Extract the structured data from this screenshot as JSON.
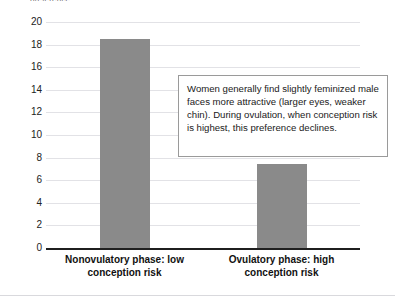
{
  "axis_caption": "preference",
  "annotation": {
    "text": "Women generally find slightly feminized male faces more attractive (larger eyes, weaker chin). During ovulation, when conception risk is highest, this preference declines."
  },
  "colors": {
    "bar": "#8a8a8a",
    "gridline": "#e2e2e6",
    "axis": "#1f1f1f",
    "annotation_border": "#9a9a9a"
  },
  "chart_data": {
    "type": "bar",
    "title": "",
    "xlabel": "",
    "ylabel": "preference",
    "categories": [
      "Nonovulatory phase: low conception risk",
      "Ovulatory phase: high conception risk"
    ],
    "values": [
      18.5,
      7.4
    ],
    "ylim": [
      0,
      20
    ],
    "ytick_labels": [
      "20",
      "18",
      "16",
      "14",
      "12",
      "10",
      "8",
      "6",
      "4",
      "2",
      "0"
    ],
    "ytick_values": [
      20,
      18,
      16,
      14,
      12,
      10,
      8,
      6,
      4,
      2,
      0
    ],
    "grid": true,
    "legend": "none"
  }
}
